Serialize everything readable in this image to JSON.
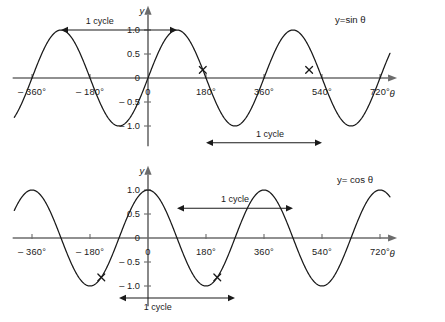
{
  "figure": {
    "background": "#ffffff",
    "axis_color": "#6b6b6b",
    "curve_color": "#1a1a1a",
    "width": 445,
    "height": 322
  },
  "charts": [
    {
      "id": "sine-chart",
      "equation_label": "y=sin θ",
      "x_axis_name": "θ",
      "y_axis_name": "y",
      "x_tick_labels": [
        "– 360°",
        "– 180°",
        "0",
        "180°",
        "360°",
        "540°",
        "720°"
      ],
      "x_tick_values": [
        -360,
        -180,
        0,
        180,
        360,
        540,
        720
      ],
      "y_tick_labels": [
        "1.0",
        "0.5",
        "0",
        "– 0.5",
        "– 1.0"
      ],
      "y_tick_values": [
        1.0,
        0.5,
        0,
        -0.5,
        -1.0
      ],
      "annotations": [
        {
          "name": "cycle-top-left",
          "text": "1 cycle",
          "from": -270,
          "to": 90,
          "level": 1.0
        },
        {
          "name": "cycle-bottom-right",
          "text": "1 cycle",
          "from": 180,
          "to": 540,
          "level": -1.35
        }
      ],
      "marks": [
        {
          "name": "x-mark-1",
          "x": 170,
          "y": 0.17
        },
        {
          "name": "x-mark-2",
          "x": 500,
          "y": 0.17
        }
      ]
    },
    {
      "id": "cosine-chart",
      "equation_label": "y= cos θ",
      "x_axis_name": "θ",
      "y_axis_name": "y",
      "x_tick_labels": [
        "– 360°",
        "– 180°",
        "0",
        "180°",
        "360°",
        "540°",
        "720°"
      ],
      "x_tick_values": [
        -360,
        -180,
        0,
        180,
        360,
        540,
        720
      ],
      "y_tick_labels": [
        "1.0",
        "0.5",
        "0",
        "– 0.5",
        "– 1.0"
      ],
      "y_tick_values": [
        1.0,
        0.5,
        0,
        -0.5,
        -1.0
      ],
      "annotations": [
        {
          "name": "cycle-top-right",
          "text": "1 cycle",
          "from": 90,
          "to": 450,
          "level": 0.62
        },
        {
          "name": "cycle-bottom-left",
          "text": "1 cycle",
          "from": -90,
          "to": 270,
          "level": -1.25
        }
      ],
      "marks": [
        {
          "name": "x-mark-1",
          "x": -145,
          "y": -0.82
        },
        {
          "name": "x-mark-2",
          "x": 215,
          "y": -0.82
        }
      ]
    }
  ],
  "chart_data": [
    {
      "type": "line",
      "id": "sine",
      "title": "y=sin θ",
      "xlabel": "θ",
      "ylabel": "y",
      "xlim": [
        -400,
        760
      ],
      "ylim": [
        -1.45,
        1.25
      ],
      "grid": false,
      "legend": "none",
      "function": "y = sin(theta)",
      "x_ticks": [
        -360,
        -180,
        0,
        180,
        360,
        540,
        720
      ],
      "x_tick_labels": [
        "– 360°",
        "– 180°",
        "0",
        "180°",
        "360°",
        "540°",
        "720°"
      ],
      "y_ticks": [
        -1.0,
        -0.5,
        0,
        0.5,
        1.0
      ],
      "y_tick_labels": [
        "– 1.0",
        "– 0.5",
        "0",
        "0.5",
        "1.0"
      ],
      "series": [
        {
          "name": "sin",
          "x": [
            -400,
            -360,
            -330,
            -300,
            -270,
            -240,
            -210,
            -180,
            -150,
            -120,
            -90,
            -60,
            -30,
            0,
            30,
            60,
            90,
            120,
            150,
            180,
            210,
            240,
            270,
            300,
            330,
            360,
            390,
            420,
            450,
            480,
            510,
            540,
            570,
            600,
            630,
            660,
            690,
            720,
            750
          ],
          "y": [
            0.64,
            0.0,
            0.5,
            0.87,
            1.0,
            0.87,
            0.5,
            0.0,
            -0.5,
            -0.87,
            -1.0,
            -0.87,
            -0.5,
            0.0,
            0.5,
            0.87,
            1.0,
            0.87,
            0.5,
            0.0,
            -0.5,
            -0.87,
            -1.0,
            -0.87,
            -0.5,
            0.0,
            0.5,
            0.87,
            1.0,
            0.87,
            0.5,
            0.0,
            -0.5,
            -0.87,
            -1.0,
            -0.87,
            -0.5,
            0.0,
            0.5
          ]
        }
      ],
      "annotations": [
        {
          "text": "1 cycle",
          "span_x": [
            -270,
            90
          ],
          "at_y": 1.0
        },
        {
          "text": "1 cycle",
          "span_x": [
            180,
            540
          ],
          "at_y": -1.35
        },
        {
          "text": "y=sin θ",
          "at_x": 560,
          "at_y": 1.2
        }
      ],
      "marked_points": [
        {
          "x": 170,
          "y": 0.17
        },
        {
          "x": 500,
          "y": 0.17
        }
      ]
    },
    {
      "type": "line",
      "id": "cosine",
      "title": "y= cos θ",
      "xlabel": "θ",
      "ylabel": "y",
      "xlim": [
        -400,
        760
      ],
      "ylim": [
        -1.45,
        1.25
      ],
      "grid": false,
      "legend": "none",
      "function": "y = cos(theta)",
      "x_ticks": [
        -360,
        -180,
        0,
        180,
        360,
        540,
        720
      ],
      "x_tick_labels": [
        "– 360°",
        "– 180°",
        "0",
        "180°",
        "360°",
        "540°",
        "720°"
      ],
      "y_ticks": [
        -1.0,
        -0.5,
        0,
        0.5,
        1.0
      ],
      "y_tick_labels": [
        "– 1.0",
        "– 0.5",
        "0",
        "0.5",
        "1.0"
      ],
      "series": [
        {
          "name": "cos",
          "x": [
            -400,
            -360,
            -330,
            -300,
            -270,
            -240,
            -210,
            -180,
            -150,
            -120,
            -90,
            -60,
            -30,
            0,
            30,
            60,
            90,
            120,
            150,
            180,
            210,
            240,
            270,
            300,
            330,
            360,
            390,
            420,
            450,
            480,
            510,
            540,
            570,
            600,
            630,
            660,
            690,
            720,
            750
          ],
          "y": [
            0.77,
            1.0,
            0.87,
            0.5,
            0.0,
            -0.5,
            -0.87,
            -1.0,
            -0.87,
            -0.5,
            0.0,
            0.5,
            0.87,
            1.0,
            0.87,
            0.5,
            0.0,
            -0.5,
            -0.87,
            -1.0,
            -0.87,
            -0.5,
            0.0,
            0.5,
            0.87,
            1.0,
            0.87,
            0.5,
            0.0,
            -0.5,
            -0.87,
            -1.0,
            -0.87,
            -0.5,
            0.0,
            0.5,
            0.87,
            1.0,
            0.87
          ]
        }
      ],
      "annotations": [
        {
          "text": "1 cycle",
          "span_x": [
            90,
            450
          ],
          "at_y": 0.62
        },
        {
          "text": "1 cycle",
          "span_x": [
            -90,
            270
          ],
          "at_y": -1.25
        },
        {
          "text": "y= cos θ",
          "at_x": 560,
          "at_y": 0.95
        }
      ],
      "marked_points": [
        {
          "x": -145,
          "y": -0.82
        },
        {
          "x": 215,
          "y": -0.82
        }
      ]
    }
  ]
}
